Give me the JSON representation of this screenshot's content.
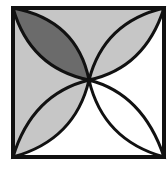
{
  "figure": {
    "square": {
      "x": 13,
      "y": 8,
      "size": 150
    },
    "colors": {
      "background": "#ffffff",
      "light_shade": "#c6c6c6",
      "dark_shade": "#6b6b6b",
      "stroke": "#111111"
    },
    "regions": [
      {
        "name": "top-region",
        "fill": "light"
      },
      {
        "name": "left-region",
        "fill": "light"
      },
      {
        "name": "right-region",
        "fill": "white"
      },
      {
        "name": "bottom-region",
        "fill": "white"
      },
      {
        "name": "petal-top-left",
        "fill": "dark"
      },
      {
        "name": "petal-top-right",
        "fill": "light"
      },
      {
        "name": "petal-bottom-left",
        "fill": "light"
      },
      {
        "name": "petal-bottom-right",
        "fill": "white"
      }
    ]
  }
}
